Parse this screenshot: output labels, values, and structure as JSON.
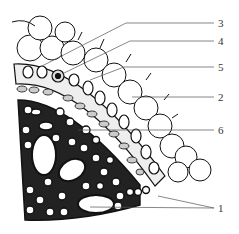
{
  "figure": {
    "type": "anatomical cross-section diagram",
    "labels": [
      {
        "id": "3",
        "text": "3",
        "y": 23,
        "target": [
          42,
          66
        ]
      },
      {
        "id": "4",
        "text": "4",
        "y": 41,
        "target": [
          62,
          74
        ]
      },
      {
        "id": "5",
        "text": "5",
        "y": 67,
        "target": [
          90,
          80
        ]
      },
      {
        "id": "2",
        "text": "2",
        "y": 97,
        "target": [
          132,
          97
        ]
      },
      {
        "id": "6",
        "text": "6",
        "y": 130,
        "target": [
          78,
          130
        ]
      },
      {
        "id": "1",
        "text": "1",
        "y": 208,
        "targets": [
          [
            158,
            196
          ],
          [
            90,
            207
          ]
        ]
      }
    ],
    "colors": {
      "line": "#111111",
      "leader": "#555555",
      "background": "#ffffff"
    }
  }
}
